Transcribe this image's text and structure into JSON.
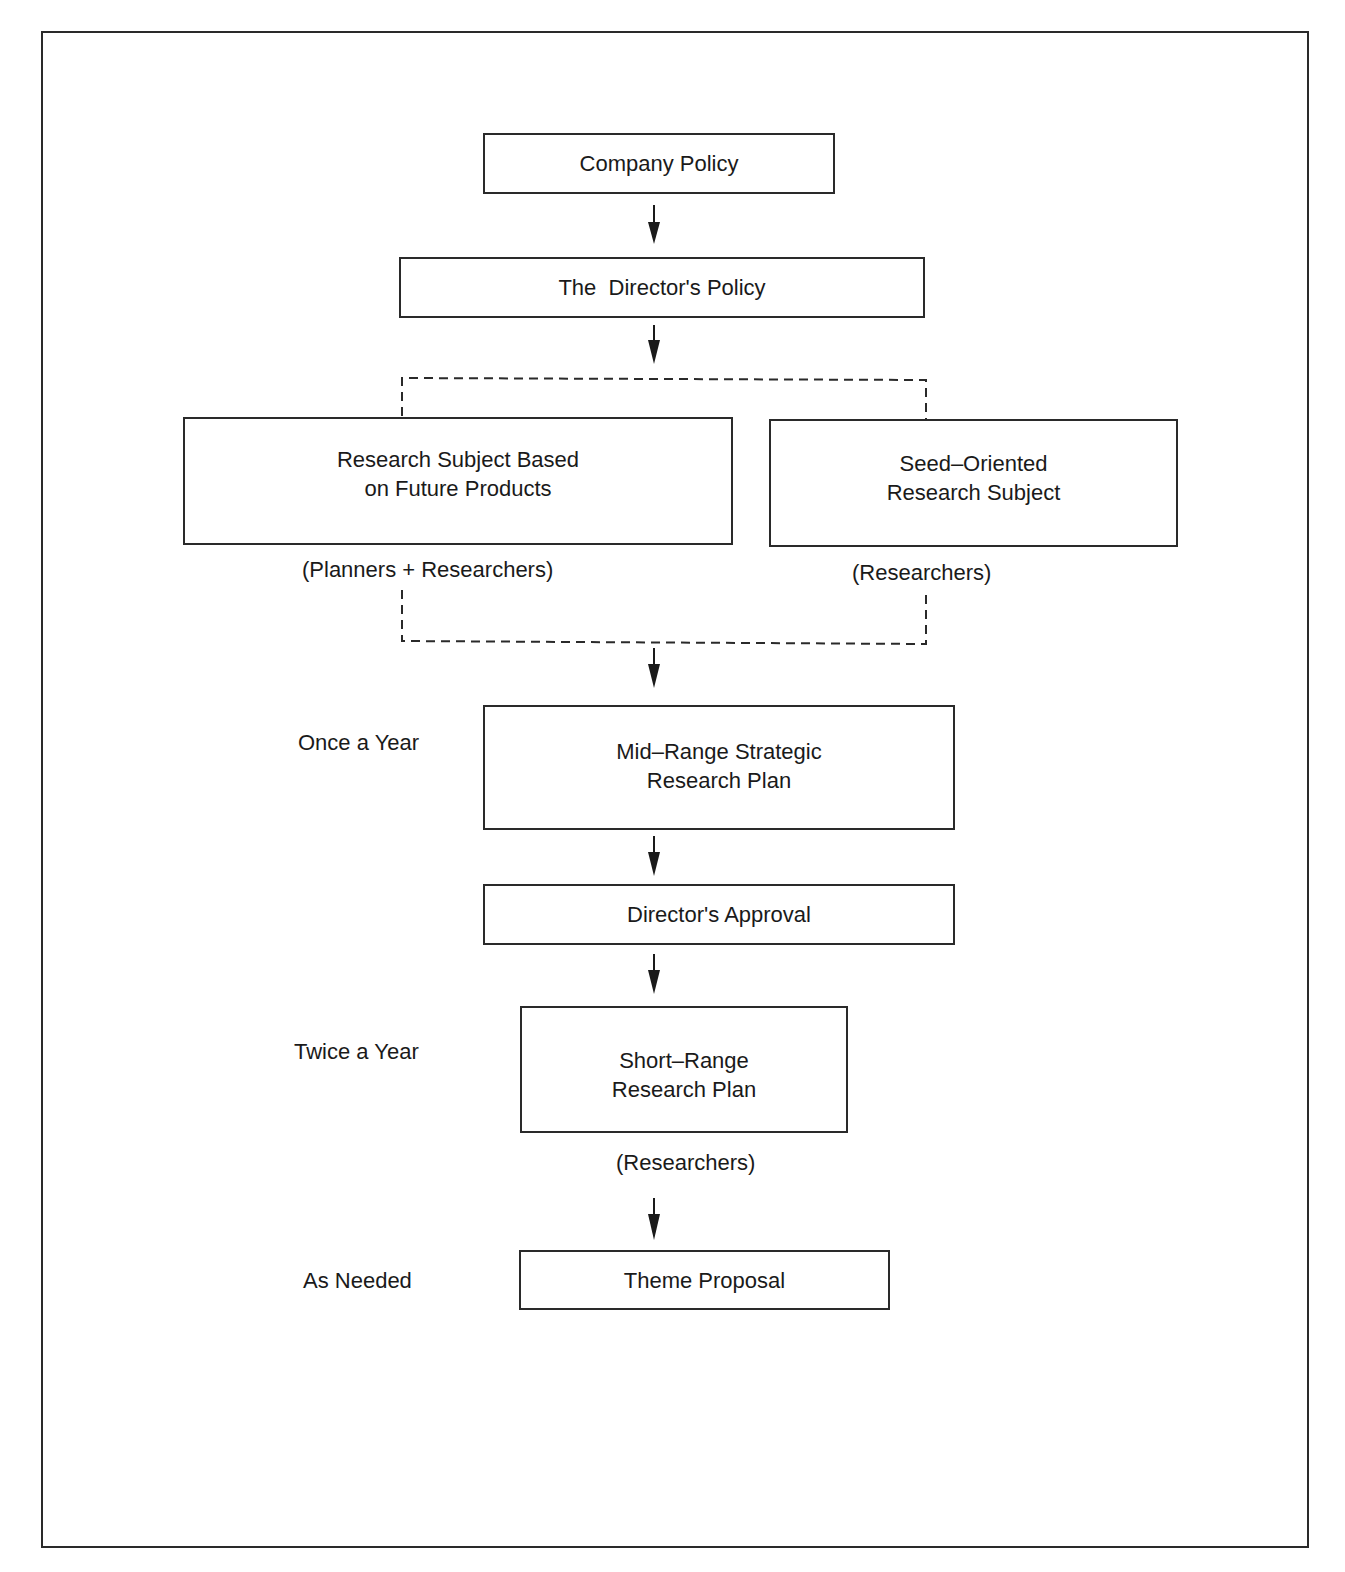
{
  "diagram": {
    "type": "flowchart",
    "nodes": {
      "company_policy": "Company Policy",
      "directors_policy": "The  Director's Policy",
      "future_products": {
        "line1": "Research Subject Based",
        "line2": "on Future Products"
      },
      "seed_oriented": {
        "line1": "Seed–Oriented",
        "line2": "Research Subject"
      },
      "mid_range": {
        "line1": "Mid–Range Strategic",
        "line2": "Research Plan"
      },
      "directors_approval": "Director's Approval",
      "short_range": {
        "line1": "Short–Range",
        "line2": "Research Plan"
      },
      "theme_proposal": "Theme Proposal"
    },
    "annotations": {
      "future_products_actors": "(Planners + Researchers)",
      "seed_oriented_actors": "(Researchers)",
      "short_range_actors": "(Researchers)"
    },
    "frequencies": {
      "mid_range": "Once a Year",
      "short_range": "Twice a Year",
      "theme_proposal": "As Needed"
    },
    "edges": [
      [
        "Company Policy",
        "The Director's Policy"
      ],
      [
        "The Director's Policy",
        "Research Subject group (dashed)"
      ],
      [
        "Research Subject group (dashed)",
        "Mid-Range Strategic Research Plan"
      ],
      [
        "Mid-Range Strategic Research Plan",
        "Director's Approval"
      ],
      [
        "Director's Approval",
        "Short-Range Research Plan"
      ],
      [
        "Short-Range Research Plan",
        "Theme Proposal"
      ]
    ],
    "colors": {
      "line": "#2a2a2a",
      "background": "#ffffff"
    }
  }
}
